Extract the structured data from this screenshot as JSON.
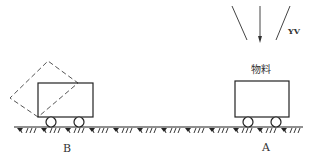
{
  "diagram": {
    "labels": {
      "material": "物料",
      "sensor": "YV",
      "point_a": "A",
      "point_b": "B"
    },
    "colors": {
      "line": "#333333",
      "dashed": "#555555",
      "background": "#ffffff"
    },
    "elements": {
      "cart_a": "cart at position A carrying material",
      "cart_b": "cart at position B with dashed tilted (dumping) outline",
      "ground": "hatched ground track",
      "rays": "three downward lines from top-right with center arrow"
    }
  }
}
